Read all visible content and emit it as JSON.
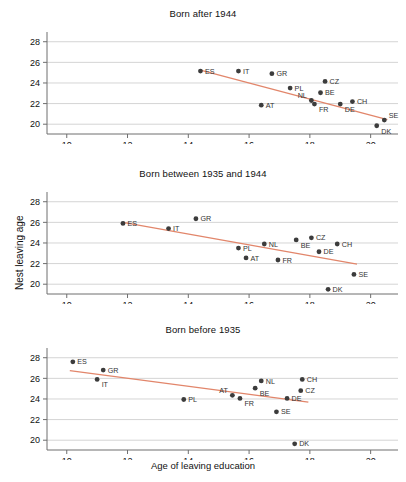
{
  "figure": {
    "xlabel": "Age of leaving education",
    "ylabel": "Nest leaving age",
    "line_color": "#e2866b",
    "point_color": "#3c3c3c",
    "grid_color": "#c9c9c9",
    "axis_color": "#6e6e6e"
  },
  "chart_data": [
    {
      "type": "scatter",
      "title": "Born after 1944",
      "xlabel": "",
      "ylabel": "Nest leaving age",
      "xlim": [
        9.35,
        20.9
      ],
      "ylim": [
        19.05,
        28.75
      ],
      "xticks": [
        10,
        12,
        14,
        16,
        18,
        20
      ],
      "yticks": [
        20,
        22,
        24,
        26,
        28
      ],
      "grid": true,
      "legend": "none",
      "points": [
        {
          "label": "ES",
          "x": 14.4,
          "y": 25.15,
          "lx": "right",
          "ly": "mid"
        },
        {
          "label": "IT",
          "x": 15.65,
          "y": 25.15,
          "lx": "right",
          "ly": "mid"
        },
        {
          "label": "GR",
          "x": 16.75,
          "y": 24.9,
          "lx": "right",
          "ly": "mid"
        },
        {
          "label": "CZ",
          "x": 18.5,
          "y": 24.15,
          "lx": "right",
          "ly": "mid"
        },
        {
          "label": "PL",
          "x": 17.35,
          "y": 23.5,
          "lx": "right",
          "ly": "mid"
        },
        {
          "label": "BE",
          "x": 18.35,
          "y": 23.05,
          "lx": "right",
          "ly": "mid"
        },
        {
          "label": "NL",
          "x": 18.05,
          "y": 22.3,
          "lx": "left",
          "ly": "up"
        },
        {
          "label": "FR",
          "x": 18.15,
          "y": 21.95,
          "lx": "right",
          "ly": "down"
        },
        {
          "label": "CH",
          "x": 19.4,
          "y": 22.2,
          "lx": "right",
          "ly": "mid"
        },
        {
          "label": "DE",
          "x": 19.0,
          "y": 21.95,
          "lx": "right",
          "ly": "down"
        },
        {
          "label": "AT",
          "x": 16.4,
          "y": 21.85,
          "lx": "right",
          "ly": "mid"
        },
        {
          "label": "SE",
          "x": 20.45,
          "y": 20.4,
          "lx": "right",
          "ly": "up"
        },
        {
          "label": "DK",
          "x": 20.2,
          "y": 19.85,
          "lx": "right",
          "ly": "down"
        }
      ],
      "trendline": {
        "x1": 14.4,
        "y1": 25.25,
        "x2": 20.55,
        "y2": 20.45
      }
    },
    {
      "type": "scatter",
      "title": "Born between 1935 and 1944",
      "xlabel": "",
      "ylabel": "Nest leaving age",
      "xlim": [
        9.35,
        20.9
      ],
      "ylim": [
        19.05,
        28.75
      ],
      "xticks": [
        10,
        12,
        14,
        16,
        18,
        20
      ],
      "yticks": [
        20,
        22,
        24,
        26,
        28
      ],
      "grid": true,
      "legend": "none",
      "points": [
        {
          "label": "ES",
          "x": 11.85,
          "y": 25.9,
          "lx": "right",
          "ly": "mid"
        },
        {
          "label": "IT",
          "x": 13.35,
          "y": 25.4,
          "lx": "right",
          "ly": "mid"
        },
        {
          "label": "GR",
          "x": 14.25,
          "y": 26.35,
          "lx": "right",
          "ly": "mid"
        },
        {
          "label": "PL",
          "x": 15.65,
          "y": 23.5,
          "lx": "right",
          "ly": "mid"
        },
        {
          "label": "AT",
          "x": 15.9,
          "y": 22.55,
          "lx": "right",
          "ly": "mid"
        },
        {
          "label": "NL",
          "x": 16.5,
          "y": 23.9,
          "lx": "right",
          "ly": "mid"
        },
        {
          "label": "FR",
          "x": 16.95,
          "y": 22.35,
          "lx": "right",
          "ly": "mid"
        },
        {
          "label": "BE",
          "x": 17.55,
          "y": 24.3,
          "lx": "right",
          "ly": "down"
        },
        {
          "label": "CZ",
          "x": 18.05,
          "y": 24.5,
          "lx": "right",
          "ly": "mid"
        },
        {
          "label": "DE",
          "x": 18.3,
          "y": 23.15,
          "lx": "right",
          "ly": "mid"
        },
        {
          "label": "CH",
          "x": 18.9,
          "y": 23.9,
          "lx": "right",
          "ly": "mid"
        },
        {
          "label": "SE",
          "x": 19.45,
          "y": 20.95,
          "lx": "right",
          "ly": "mid"
        },
        {
          "label": "DK",
          "x": 18.6,
          "y": 19.5,
          "lx": "right",
          "ly": "mid"
        }
      ],
      "trendline": {
        "x1": 11.85,
        "y1": 26.0,
        "x2": 19.55,
        "y2": 21.95
      }
    },
    {
      "type": "scatter",
      "title": "Born before 1935",
      "xlabel": "Age of leaving education",
      "ylabel": "Nest leaving age",
      "xlim": [
        9.35,
        20.9
      ],
      "ylim": [
        19.05,
        28.75
      ],
      "xticks": [
        10,
        12,
        14,
        16,
        18,
        20
      ],
      "yticks": [
        20,
        22,
        24,
        26,
        28
      ],
      "grid": true,
      "legend": "none",
      "points": [
        {
          "label": "ES",
          "x": 10.2,
          "y": 27.6,
          "lx": "right",
          "ly": "mid"
        },
        {
          "label": "GR",
          "x": 11.2,
          "y": 26.8,
          "lx": "right",
          "ly": "mid"
        },
        {
          "label": "IT",
          "x": 11.0,
          "y": 25.9,
          "lx": "right",
          "ly": "down"
        },
        {
          "label": "PL",
          "x": 13.85,
          "y": 23.95,
          "lx": "right",
          "ly": "mid"
        },
        {
          "label": "AT",
          "x": 15.45,
          "y": 24.35,
          "lx": "left",
          "ly": "up"
        },
        {
          "label": "FR",
          "x": 15.7,
          "y": 24.05,
          "lx": "right",
          "ly": "down"
        },
        {
          "label": "BE",
          "x": 16.2,
          "y": 25.05,
          "lx": "right",
          "ly": "down"
        },
        {
          "label": "NL",
          "x": 16.4,
          "y": 25.75,
          "lx": "right",
          "ly": "mid"
        },
        {
          "label": "SE",
          "x": 16.9,
          "y": 22.75,
          "lx": "right",
          "ly": "mid"
        },
        {
          "label": "DE",
          "x": 17.25,
          "y": 24.05,
          "lx": "right",
          "ly": "mid"
        },
        {
          "label": "CZ",
          "x": 17.7,
          "y": 24.8,
          "lx": "right",
          "ly": "mid"
        },
        {
          "label": "CH",
          "x": 17.75,
          "y": 25.9,
          "lx": "right",
          "ly": "mid"
        },
        {
          "label": "DK",
          "x": 17.5,
          "y": 19.65,
          "lx": "right",
          "ly": "mid"
        }
      ],
      "trendline": {
        "x1": 10.1,
        "y1": 26.75,
        "x2": 17.95,
        "y2": 23.7
      }
    }
  ]
}
